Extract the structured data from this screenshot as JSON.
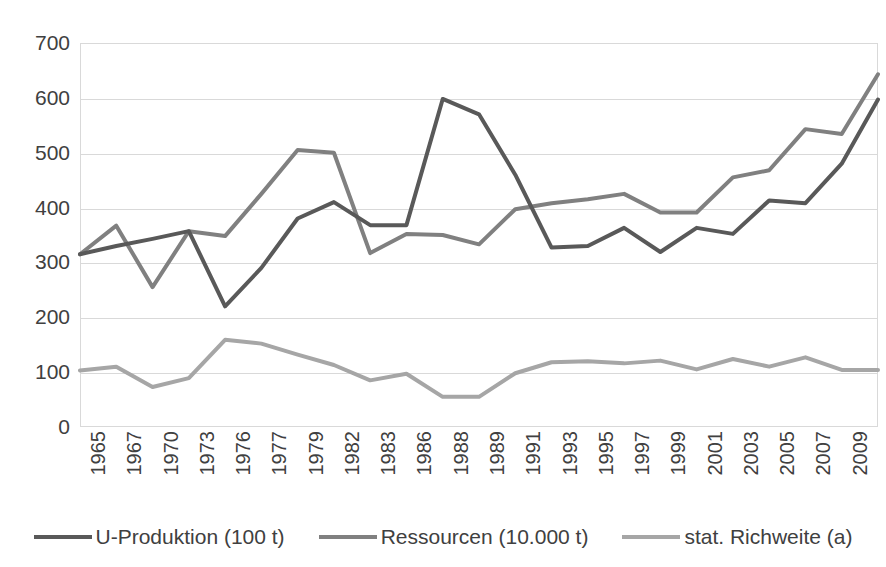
{
  "chart_data": {
    "type": "line",
    "title": "",
    "subtitle": "",
    "xlabel": "",
    "ylabel": "",
    "ylim": [
      0,
      700
    ],
    "ytick_step": 100,
    "grid": true,
    "legend_position": "bottom",
    "categories": [
      "1965",
      "1967",
      "1970",
      "1973",
      "1976",
      "1977",
      "1979",
      "1982",
      "1983",
      "1986",
      "1988",
      "1989",
      "1991",
      "1993",
      "1995",
      "1997",
      "1999",
      "2001",
      "2003",
      "2005",
      "2007",
      "2009",
      "2015"
    ],
    "ytick_labels": [
      "700",
      "600",
      "500",
      "400",
      "300",
      "200",
      "100",
      "0"
    ],
    "series": [
      {
        "name": "U-Produktion (100 t)",
        "color": "#595959",
        "values": [
          315,
          330,
          343,
          357,
          220,
          290,
          380,
          410,
          368,
          368,
          598,
          570,
          460,
          327,
          330,
          363,
          319,
          363,
          352,
          413,
          408,
          480,
          597
        ]
      },
      {
        "name": "Ressourcen (10.000 t)",
        "color": "#808080",
        "values": [
          315,
          367,
          255,
          357,
          348,
          425,
          505,
          500,
          317,
          352,
          350,
          333,
          397,
          408,
          415,
          425,
          391,
          391,
          455,
          468,
          543,
          534,
          643
        ]
      },
      {
        "name": "stat. Richweite (a)",
        "color": "#a6a6a6",
        "values": [
          103,
          110,
          73,
          89,
          159,
          152,
          132,
          113,
          85,
          97,
          55,
          55,
          98,
          118,
          120,
          116,
          121,
          105,
          124,
          110,
          127,
          104,
          104
        ]
      }
    ]
  },
  "legend": {
    "items": [
      {
        "label": "U-Produktion (100 t)",
        "color": "#595959"
      },
      {
        "label": "Ressourcen (10.000 t)",
        "color": "#808080"
      },
      {
        "label": "stat. Richweite (a)",
        "color": "#a6a6a6"
      }
    ]
  },
  "colors": {
    "background": "#ffffff",
    "grid": "#d9d9d9",
    "text": "#404040"
  }
}
